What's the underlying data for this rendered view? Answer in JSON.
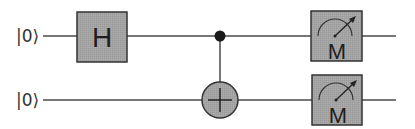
{
  "circuit": {
    "qubits": [
      {
        "label": "|0⟩",
        "y": 36
      },
      {
        "label": "|0⟩",
        "y": 100
      }
    ],
    "gates": [
      {
        "type": "single",
        "name": "Hadamard",
        "symbol": "H",
        "qubit": 0
      },
      {
        "type": "controlled",
        "name": "CNOT",
        "control_qubit": 0,
        "target_qubit": 1,
        "target_symbol": "⊕"
      },
      {
        "type": "measure",
        "symbol": "M",
        "qubit": 0
      },
      {
        "type": "measure",
        "symbol": "M",
        "qubit": 1
      }
    ],
    "h_gate": {
      "symbol": "H"
    },
    "measure_top": {
      "symbol": "M"
    },
    "measure_bottom": {
      "symbol": "M"
    },
    "colors": {
      "wire": "#4a4a4a",
      "gate_fill": "#a3a3a3",
      "gate_stroke": "#333333",
      "target_fill": "#b5b5b5",
      "control_dot": "#1a1a1a"
    }
  }
}
